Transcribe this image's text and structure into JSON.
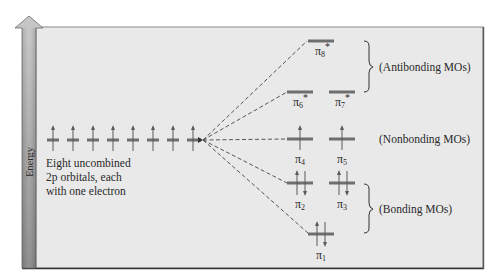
{
  "diagram": {
    "type": "molecular-orbital-energy-diagram",
    "axis": {
      "label": "Energy",
      "direction": "up"
    },
    "colors": {
      "panel_background": "#e9e9e9",
      "panel_border": "#7a7a7a",
      "energy_bar_top": "#c4c4c4",
      "energy_bar_bottom": "#8a8a8a",
      "level_line": "#6e6e6e",
      "text": "#2a2a2a"
    },
    "atomic_orbitals": {
      "count": 8,
      "electrons_each": 1,
      "caption_lines": [
        "Eight uncombined",
        "2p orbitals, each",
        "with one electron"
      ]
    },
    "molecular_orbitals": [
      {
        "id": "pi8",
        "symbol": "π",
        "sub": "8",
        "star": "*",
        "group": "antibonding",
        "electrons": 0
      },
      {
        "id": "pi6",
        "symbol": "π",
        "sub": "6",
        "star": "*",
        "group": "antibonding",
        "electrons": 0
      },
      {
        "id": "pi7",
        "symbol": "π",
        "sub": "7",
        "star": "*",
        "group": "antibonding",
        "electrons": 0
      },
      {
        "id": "pi4",
        "symbol": "π",
        "sub": "4",
        "star": "",
        "group": "nonbonding",
        "electrons": 1
      },
      {
        "id": "pi5",
        "symbol": "π",
        "sub": "5",
        "star": "",
        "group": "nonbonding",
        "electrons": 1
      },
      {
        "id": "pi2",
        "symbol": "π",
        "sub": "2",
        "star": "",
        "group": "bonding",
        "electrons": 2
      },
      {
        "id": "pi3",
        "symbol": "π",
        "sub": "3",
        "star": "",
        "group": "bonding",
        "electrons": 2
      },
      {
        "id": "pi1",
        "symbol": "π",
        "sub": "1",
        "star": "",
        "group": "bonding",
        "electrons": 2
      }
    ],
    "group_labels": {
      "antibonding": "(Antibonding MOs)",
      "nonbonding": "(Nonbonding MOs)",
      "bonding": "(Bonding MOs)"
    }
  }
}
